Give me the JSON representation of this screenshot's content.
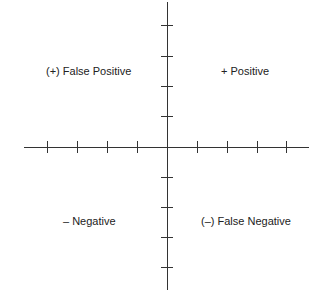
{
  "diagram": {
    "type": "quadrant",
    "axes": {
      "origin": {
        "x": 167,
        "y": 147
      },
      "x_axis": {
        "from": 24,
        "to": 309,
        "ticks": [
          47,
          77,
          107,
          137,
          197,
          227,
          257,
          286
        ]
      },
      "y_axis": {
        "from": 2,
        "to": 290,
        "ticks": [
          25,
          56,
          86,
          116,
          177,
          207,
          237,
          267
        ]
      },
      "tick_half_length": 6,
      "color": "#333333"
    },
    "quadrants": {
      "top_left": {
        "label": "(+) False Positive"
      },
      "top_right": {
        "label": "+ Positive"
      },
      "bottom_left": {
        "label": "– Negative"
      },
      "bottom_right": {
        "label": "(–) False Negative"
      }
    }
  }
}
